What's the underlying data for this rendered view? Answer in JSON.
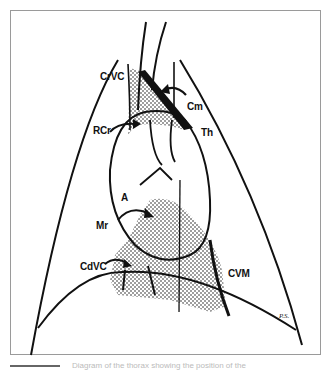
{
  "figure": {
    "labels": {
      "crvc": "CrVC",
      "cm": "Cm",
      "rcr": "RCr",
      "th": "Th",
      "a": "A",
      "mr": "Mr",
      "cdvc": "CdVC",
      "cvm": "CVM"
    },
    "signature": "P.S.",
    "stipple_color": "#222222",
    "line_color": "#111111"
  },
  "caption": {
    "text": "Diagram of the thorax showing the position of the"
  }
}
